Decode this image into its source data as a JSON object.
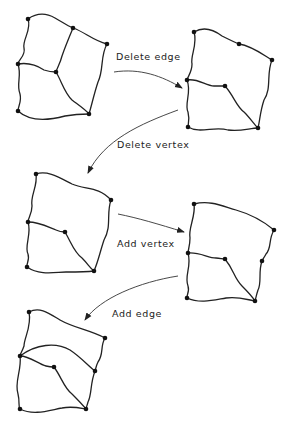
{
  "labels": {
    "step1": "Delete edge",
    "step2": "Delete vertex",
    "step3": "Add vertex",
    "step4": "Add edge"
  },
  "graphs": [
    {
      "name": "original",
      "vertices": [
        [
          28,
          19
        ],
        [
          73,
          28
        ],
        [
          107,
          44
        ],
        [
          18,
          64
        ],
        [
          56,
          72
        ],
        [
          18,
          111
        ],
        [
          89,
          114
        ]
      ]
    },
    {
      "name": "after-delete-edge",
      "vertices": [
        [
          194,
          32
        ],
        [
          239,
          44
        ],
        [
          272,
          60
        ],
        [
          187,
          80
        ],
        [
          225,
          86
        ],
        [
          188,
          127
        ],
        [
          258,
          128
        ]
      ]
    },
    {
      "name": "after-delete-vertex",
      "vertices": [
        [
          36,
          174
        ],
        [
          111,
          200
        ],
        [
          28,
          222
        ],
        [
          65,
          232
        ],
        [
          27,
          267
        ],
        [
          94,
          271
        ]
      ]
    },
    {
      "name": "after-add-vertex",
      "vertices": [
        [
          194,
          204
        ],
        [
          274,
          230
        ],
        [
          188,
          253
        ],
        [
          225,
          259
        ],
        [
          262,
          261
        ],
        [
          187,
          298
        ],
        [
          255,
          301
        ]
      ]
    },
    {
      "name": "after-add-edge",
      "vertices": [
        [
          29,
          312
        ],
        [
          105,
          338
        ],
        [
          20,
          356
        ],
        [
          54,
          367
        ],
        [
          95,
          371
        ],
        [
          20,
          409
        ],
        [
          86,
          409
        ]
      ]
    }
  ],
  "colors": {
    "ink": "#222222",
    "background": "#ffffff"
  }
}
